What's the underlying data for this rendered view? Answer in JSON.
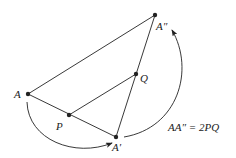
{
  "points": {
    "A": {
      "label": "A",
      "x": 28,
      "y": 94
    },
    "A2": {
      "label": "A″",
      "x": 155,
      "y": 15
    },
    "Q": {
      "label": "Q",
      "x": 136,
      "y": 74
    },
    "P": {
      "label": "P",
      "x": 69,
      "y": 115
    },
    "A1": {
      "label": "A′",
      "x": 116,
      "y": 137
    }
  },
  "equation": "AA″ = 2PQ",
  "colors": {
    "stroke": "#222222"
  }
}
